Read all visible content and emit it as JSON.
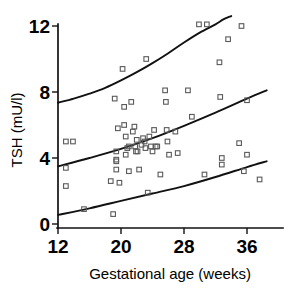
{
  "chart_data": {
    "type": "scatter",
    "title": "",
    "xlabel": "Gestational age (weeks)",
    "ylabel": "TSH (mU/l)",
    "xlim": [
      12,
      39
    ],
    "ylim": [
      0,
      12.6
    ],
    "xticks": [
      12,
      20,
      28,
      36
    ],
    "xticklabels": [
      "12",
      "20",
      "28",
      "36"
    ],
    "yticks": [
      0,
      4,
      8,
      12
    ],
    "yticklabels": [
      "0",
      "4",
      "8",
      "12"
    ],
    "grid": false,
    "legend": "none",
    "marker": "open-square",
    "points": [
      {
        "x": 13.0,
        "y": 5.0
      },
      {
        "x": 13.9,
        "y": 5.0
      },
      {
        "x": 13.0,
        "y": 3.4
      },
      {
        "x": 13.0,
        "y": 2.3
      },
      {
        "x": 15.3,
        "y": 0.9
      },
      {
        "x": 18.7,
        "y": 2.6
      },
      {
        "x": 19.0,
        "y": 0.6
      },
      {
        "x": 19.2,
        "y": 7.6
      },
      {
        "x": 19.4,
        "y": 4.4
      },
      {
        "x": 19.4,
        "y": 3.9
      },
      {
        "x": 19.4,
        "y": 3.8
      },
      {
        "x": 19.4,
        "y": 3.3
      },
      {
        "x": 19.6,
        "y": 5.8
      },
      {
        "x": 19.8,
        "y": 2.5
      },
      {
        "x": 20.2,
        "y": 9.4
      },
      {
        "x": 20.4,
        "y": 7.1
      },
      {
        "x": 20.4,
        "y": 6.0
      },
      {
        "x": 20.6,
        "y": 5.3
      },
      {
        "x": 20.6,
        "y": 4.2
      },
      {
        "x": 20.8,
        "y": 4.6
      },
      {
        "x": 21.0,
        "y": 3.2
      },
      {
        "x": 21.0,
        "y": 4.7
      },
      {
        "x": 21.3,
        "y": 7.4
      },
      {
        "x": 21.5,
        "y": 5.6
      },
      {
        "x": 21.7,
        "y": 5.9
      },
      {
        "x": 21.8,
        "y": 4.7
      },
      {
        "x": 21.9,
        "y": 4.4
      },
      {
        "x": 22.0,
        "y": 5.1
      },
      {
        "x": 22.1,
        "y": 4.4
      },
      {
        "x": 22.3,
        "y": 3.3
      },
      {
        "x": 22.6,
        "y": 4.8
      },
      {
        "x": 22.8,
        "y": 5.2
      },
      {
        "x": 23.0,
        "y": 5.0
      },
      {
        "x": 23.1,
        "y": 4.6
      },
      {
        "x": 23.2,
        "y": 10.0
      },
      {
        "x": 23.4,
        "y": 1.9
      },
      {
        "x": 23.6,
        "y": 5.3
      },
      {
        "x": 23.8,
        "y": 4.7
      },
      {
        "x": 24.0,
        "y": 4.4
      },
      {
        "x": 24.2,
        "y": 5.7
      },
      {
        "x": 24.4,
        "y": 4.7
      },
      {
        "x": 24.6,
        "y": 4.7
      },
      {
        "x": 25.0,
        "y": 3.0
      },
      {
        "x": 25.6,
        "y": 8.1
      },
      {
        "x": 25.7,
        "y": 7.4
      },
      {
        "x": 25.8,
        "y": 5.7
      },
      {
        "x": 25.9,
        "y": 5.0
      },
      {
        "x": 26.1,
        "y": 4.2
      },
      {
        "x": 26.9,
        "y": 5.6
      },
      {
        "x": 27.2,
        "y": 4.3
      },
      {
        "x": 28.5,
        "y": 8.1
      },
      {
        "x": 29.0,
        "y": 6.5
      },
      {
        "x": 29.9,
        "y": 12.1
      },
      {
        "x": 30.9,
        "y": 12.1
      },
      {
        "x": 30.6,
        "y": 3.0
      },
      {
        "x": 32.5,
        "y": 9.8
      },
      {
        "x": 32.6,
        "y": 7.7
      },
      {
        "x": 32.8,
        "y": 4.0
      },
      {
        "x": 32.8,
        "y": 3.6
      },
      {
        "x": 33.6,
        "y": 11.2
      },
      {
        "x": 35.3,
        "y": 12.0
      },
      {
        "x": 35.0,
        "y": 4.9
      },
      {
        "x": 35.6,
        "y": 3.2
      },
      {
        "x": 36.0,
        "y": 7.5
      },
      {
        "x": 36.0,
        "y": 4.2
      },
      {
        "x": 37.6,
        "y": 2.7
      }
    ],
    "curves": [
      {
        "name": "upper-reference-curve",
        "points": [
          [
            12.0,
            7.35
          ],
          [
            14.0,
            7.6
          ],
          [
            16.0,
            7.9
          ],
          [
            18.0,
            8.25
          ],
          [
            20.0,
            8.7
          ],
          [
            22.0,
            9.2
          ],
          [
            24.0,
            9.75
          ],
          [
            26.0,
            10.35
          ],
          [
            28.0,
            11.0
          ],
          [
            30.0,
            11.6
          ],
          [
            32.0,
            12.1
          ],
          [
            33.0,
            12.4
          ],
          [
            34.0,
            12.6
          ]
        ]
      },
      {
        "name": "median-reference-curve",
        "points": [
          [
            12.0,
            3.5
          ],
          [
            16.0,
            4.0
          ],
          [
            20.0,
            4.55
          ],
          [
            24.0,
            5.2
          ],
          [
            28.0,
            5.95
          ],
          [
            32.0,
            6.75
          ],
          [
            36.0,
            7.6
          ],
          [
            38.5,
            8.1
          ]
        ]
      },
      {
        "name": "lower-reference-curve",
        "points": [
          [
            12.0,
            0.55
          ],
          [
            16.0,
            0.95
          ],
          [
            20.0,
            1.4
          ],
          [
            24.0,
            1.85
          ],
          [
            28.0,
            2.3
          ],
          [
            32.0,
            2.85
          ],
          [
            36.0,
            3.45
          ],
          [
            38.5,
            3.8
          ]
        ]
      }
    ]
  }
}
